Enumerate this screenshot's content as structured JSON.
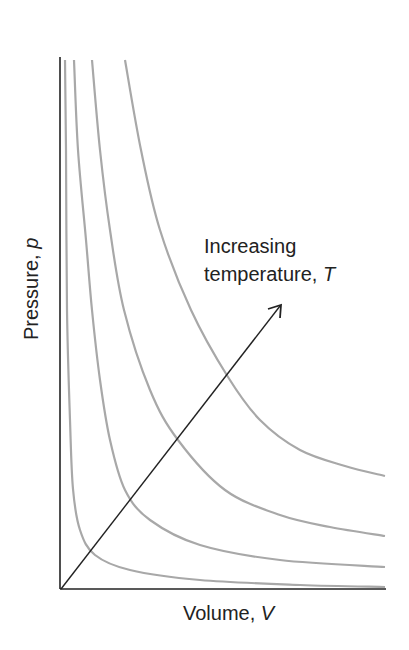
{
  "chart_data": {
    "type": "line",
    "title": "",
    "xlabel": "Volume, V",
    "ylabel": "Pressure, p",
    "xlabel_parts": {
      "text": "Volume, ",
      "var": "V"
    },
    "ylabel_parts": {
      "text": "Pressure, ",
      "var": "p"
    },
    "annotation": {
      "line1": "Increasing",
      "line2_text": "temperature, ",
      "line2_var": "T"
    },
    "grid": false,
    "ticks": false,
    "colors": {
      "axes": "#222222",
      "curves": "#a8a8a8",
      "arrow": "#222222"
    },
    "axes_px": {
      "origin": [
        60,
        589
      ],
      "x_end": [
        386,
        589
      ],
      "y_end": [
        60,
        57
      ]
    },
    "arrow_px": {
      "from": [
        61,
        589
      ],
      "to": [
        281,
        305
      ]
    },
    "series": [
      {
        "name": "T1 (lowest)",
        "points_px": [
          [
            65,
            60
          ],
          [
            66,
            150
          ],
          [
            67,
            310
          ],
          [
            70,
            420
          ],
          [
            73,
            489
          ],
          [
            80,
            530
          ],
          [
            95,
            555
          ],
          [
            130,
            570
          ],
          [
            200,
            580
          ],
          [
            300,
            585
          ],
          [
            385,
            587
          ]
        ]
      },
      {
        "name": "T2",
        "points_px": [
          [
            74,
            60
          ],
          [
            78,
            150
          ],
          [
            86,
            240
          ],
          [
            92,
            310
          ],
          [
            100,
            380
          ],
          [
            110,
            440
          ],
          [
            125,
            490
          ],
          [
            150,
            520
          ],
          [
            200,
            545
          ],
          [
            280,
            560
          ],
          [
            385,
            567
          ]
        ]
      },
      {
        "name": "T3",
        "points_px": [
          [
            92,
            60
          ],
          [
            100,
            150
          ],
          [
            110,
            230
          ],
          [
            124,
            310
          ],
          [
            150,
            390
          ],
          [
            178,
            440
          ],
          [
            225,
            490
          ],
          [
            280,
            515
          ],
          [
            330,
            527
          ],
          [
            385,
            536
          ]
        ]
      },
      {
        "name": "T4 (highest)",
        "points_px": [
          [
            125,
            60
          ],
          [
            141,
            150
          ],
          [
            160,
            230
          ],
          [
            191,
            310
          ],
          [
            228,
            377
          ],
          [
            260,
            420
          ],
          [
            300,
            450
          ],
          [
            345,
            466
          ],
          [
            385,
            476
          ]
        ]
      }
    ]
  }
}
